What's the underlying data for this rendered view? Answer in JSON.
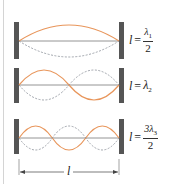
{
  "diagram": {
    "colors": {
      "wave_solid": "#e8955a",
      "wave_dashed": "#8a8f98",
      "axis": "#7a7a7a",
      "wall": "#555555",
      "text": "#222222"
    },
    "panels": [
      {
        "id": "mode-1",
        "label_var": "l",
        "label_eq": "=",
        "numerator": "λ",
        "numerator_sub": "1",
        "denominator": "2",
        "half_wavelengths": 1
      },
      {
        "id": "mode-2",
        "label_var": "l",
        "label_eq": "=",
        "value": "λ",
        "value_sub": "2",
        "half_wavelengths": 2
      },
      {
        "id": "mode-3",
        "label_var": "l",
        "label_eq": "=",
        "numerator": "3λ",
        "numerator_sub": "3",
        "denominator": "2",
        "half_wavelengths": 3
      }
    ],
    "dimension": {
      "label": "l"
    }
  }
}
